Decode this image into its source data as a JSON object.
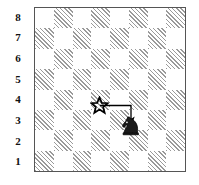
{
  "figure": {
    "type": "chess-board-diagram"
  },
  "board": {
    "ranks": [
      "8",
      "7",
      "6",
      "5",
      "4",
      "3",
      "2",
      "1"
    ],
    "files": [
      "a",
      "b",
      "c",
      "d",
      "e",
      "f",
      "g",
      "h"
    ],
    "light_color": "#ffffff",
    "dark_color": "#9a9a9a",
    "border_color": "#555555",
    "light_square_name": "light-square",
    "dark_square_name": "dark-square",
    "squares": [
      [
        "light",
        "dark",
        "light",
        "dark",
        "light",
        "dark",
        "light",
        "dark"
      ],
      [
        "dark",
        "light",
        "dark",
        "light",
        "dark",
        "light",
        "dark",
        "light"
      ],
      [
        "light",
        "dark",
        "light",
        "dark",
        "light",
        "dark",
        "light",
        "dark"
      ],
      [
        "dark",
        "light",
        "dark",
        "light",
        "dark",
        "light",
        "dark",
        "light"
      ],
      [
        "light",
        "dark",
        "light",
        "dark",
        "light",
        "dark",
        "light",
        "dark"
      ],
      [
        "dark",
        "light",
        "dark",
        "light",
        "dark",
        "light",
        "dark",
        "light"
      ],
      [
        "light",
        "dark",
        "light",
        "dark",
        "light",
        "dark",
        "light",
        "dark"
      ],
      [
        "dark",
        "light",
        "dark",
        "light",
        "dark",
        "light",
        "dark",
        "light"
      ]
    ]
  },
  "marks": {
    "star": {
      "icon": "star-icon",
      "square": "d4",
      "file_index": 3,
      "rank_index": 4,
      "color": "#000000",
      "label": "star"
    },
    "knight": {
      "icon": "knight-icon",
      "square": "f3",
      "file_index": 5,
      "rank_index": 5,
      "color": "#000000",
      "side": "black",
      "label": "black knight"
    },
    "arrow": {
      "icon": "arrow-icon",
      "from_square": "d4",
      "to_square": "f4",
      "direction": "right-then-down",
      "color": "#000000",
      "label": "move arrow"
    }
  }
}
